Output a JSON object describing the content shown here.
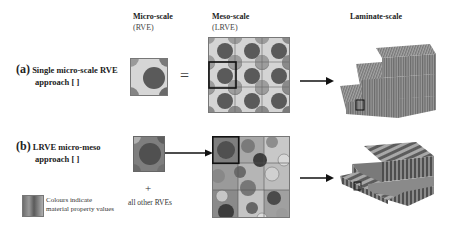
{
  "columns": {
    "micro": {
      "title": "Micro-scale",
      "subtitle": "(RVE)"
    },
    "meso": {
      "title": "Meso-scale",
      "subtitle": "(LRVE)"
    },
    "laminate": {
      "title": "Laminate-scale"
    }
  },
  "rows": [
    {
      "marker": "(a)",
      "line1": "Single micro-scale RVE",
      "line2": "approach [  ]",
      "operator": "="
    },
    {
      "marker": "(b)",
      "line1": "LRVE micro-meso",
      "line2": "approach [  ]",
      "plus": "+",
      "extra": "all other RVEs"
    }
  ],
  "legend": {
    "line1": "Colours indicate",
    "line2": "material property values"
  },
  "colors": {
    "fibre_dark": "#555555",
    "fibre_mid": "#7a7a7a",
    "matrix_light": "#cfcfcf",
    "matrix_mid": "#9a9a9a",
    "outline": "#111111"
  }
}
